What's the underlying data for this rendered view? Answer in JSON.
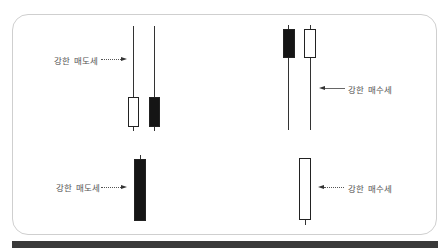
{
  "diagram": {
    "top_left": {
      "label": "강한 매도세",
      "candles": [
        {
          "color": "white",
          "type": "long-upper-shadow"
        },
        {
          "color": "black",
          "type": "long-upper-shadow"
        }
      ]
    },
    "top_right": {
      "label": "강한 매수세",
      "candles": [
        {
          "color": "black",
          "type": "long-lower-shadow"
        },
        {
          "color": "white",
          "type": "long-lower-shadow"
        }
      ]
    },
    "bottom_left": {
      "label": "강한 매도세",
      "candles": [
        {
          "color": "black",
          "type": "long-body"
        }
      ]
    },
    "bottom_right": {
      "label": "강한 매수세",
      "candles": [
        {
          "color": "white",
          "type": "long-body"
        }
      ]
    }
  },
  "colors": {
    "frame_border": "#cfcfcf",
    "candle_black": "#151515",
    "candle_white": "#ffffff",
    "bottom_bar": "#3a3a3a",
    "label_text": "#555555"
  }
}
